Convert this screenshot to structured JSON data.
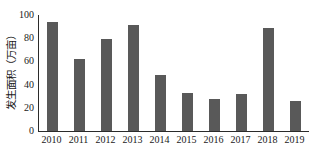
{
  "chart_data": {
    "type": "bar",
    "title": "",
    "xlabel": "",
    "ylabel": "发生面积（万亩）",
    "categories": [
      "2010",
      "2011",
      "2012",
      "2013",
      "2014",
      "2015",
      "2016",
      "2017",
      "2018",
      "2019"
    ],
    "values": [
      94,
      62,
      79,
      91,
      48,
      33,
      28,
      32,
      89,
      26
    ],
    "ylim": [
      0,
      100
    ],
    "yticks": [
      "0",
      "20",
      "40",
      "60",
      "80",
      "100"
    ],
    "ytick_values": [
      0,
      20,
      40,
      60,
      80,
      100
    ],
    "grid": false,
    "legend": false,
    "bar_color": "#595959",
    "axis_color": "#2b2b2b",
    "background": "#ffffff"
  }
}
